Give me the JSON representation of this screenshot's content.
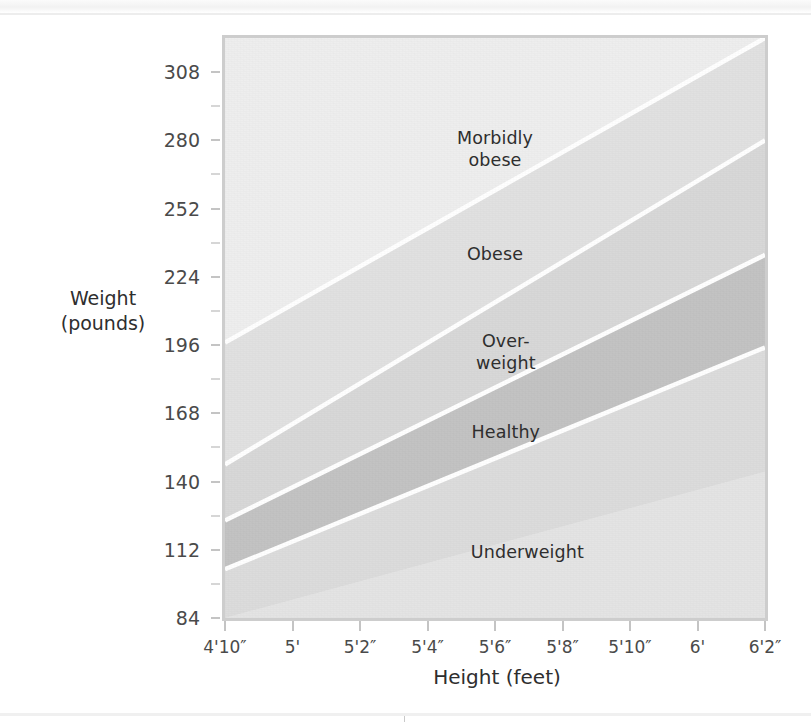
{
  "figure": {
    "yaxis_title": "Weight\n(pounds)",
    "xaxis_title": "Height (feet)"
  },
  "chart_data": {
    "type": "area",
    "title": "",
    "subtitle": "",
    "xlabel": "Height (feet)",
    "ylabel": "Weight (pounds)",
    "grid": false,
    "legend_position": "inline-labels",
    "x_tick_labels": [
      "4'10″",
      "5'",
      "5'2″",
      "5'4″",
      "5'6″",
      "5'8″",
      "5'10″",
      "6'",
      "6'2″"
    ],
    "x_heights_inches": [
      58,
      60,
      62,
      64,
      66,
      68,
      70,
      72,
      74
    ],
    "xlim_inches": [
      58,
      74
    ],
    "y_tick_labels": [
      "84",
      "112",
      "140",
      "168",
      "196",
      "224",
      "252",
      "280",
      "308"
    ],
    "y_values": [
      84,
      112,
      140,
      168,
      196,
      224,
      252,
      280,
      308
    ],
    "y_minor_step": 14,
    "ylim": [
      84,
      322
    ],
    "bands": [
      {
        "name": "Underweight",
        "label": "Underweight",
        "color": "#e4e4e4",
        "bmi_range": [
          0,
          18.5
        ],
        "weight_at_min_height": 84,
        "weight_at_max_height": 144
      },
      {
        "name": "Healthy",
        "label": "Healthy",
        "color": "#dcdcdc",
        "bmi_range": [
          18.5,
          25
        ],
        "weight_at_min_height": 104,
        "weight_at_max_height": 195
      },
      {
        "name": "Overweight",
        "label": "Over-\nweight",
        "color": "#c3c3c3",
        "bmi_range": [
          25,
          30
        ],
        "weight_at_min_height": 124,
        "weight_at_max_height": 233
      },
      {
        "name": "Obese",
        "label": "Obese",
        "color": "#d8d8d8",
        "bmi_range": [
          30,
          40
        ],
        "weight_at_min_height": 147,
        "weight_at_max_height": 280
      },
      {
        "name": "Morbidly obese",
        "label": "Morbidly\nobese",
        "color": "#e1e1e1",
        "bmi_range": [
          40,
          100
        ],
        "weight_at_min_height": 197,
        "weight_at_max_height": 322
      }
    ],
    "divider_line_color": "#ffffff",
    "plot_border_color": "#cdcdcd",
    "plot_background": "#eeeeee"
  }
}
